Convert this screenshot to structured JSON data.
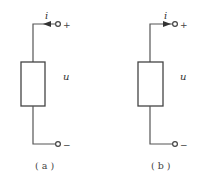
{
  "diagram": {
    "panels": [
      {
        "id": "a",
        "caption": "( a )",
        "current_label": "i",
        "voltage_label": "u",
        "plus_sign": "+",
        "minus_sign": "−",
        "arrow_direction": "left"
      },
      {
        "id": "b",
        "caption": "( b )",
        "current_label": "i",
        "voltage_label": "u",
        "plus_sign": "+",
        "minus_sign": "−",
        "arrow_direction": "right"
      }
    ],
    "colors": {
      "line": "#555555",
      "background": "#ffffff"
    }
  }
}
